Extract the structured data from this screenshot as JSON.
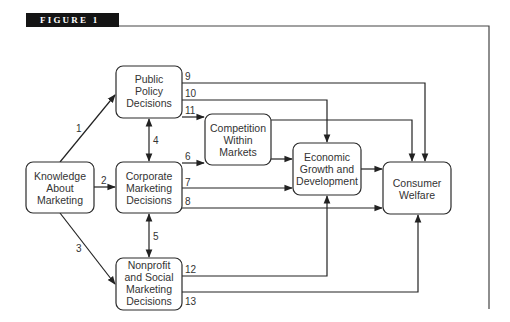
{
  "figure": {
    "title": "FIGURE 1"
  },
  "nodes": {
    "knowledge": {
      "lines": [
        "Knowledge",
        "About",
        "Marketing"
      ]
    },
    "public_policy": {
      "lines": [
        "Public",
        "Policy",
        "Decisions"
      ]
    },
    "corporate": {
      "lines": [
        "Corporate",
        "Marketing",
        "Decisions"
      ]
    },
    "nonprofit": {
      "lines": [
        "Nonprofit",
        "and Social",
        "Marketing",
        "Decisions"
      ]
    },
    "competition": {
      "lines": [
        "Competition",
        "Within",
        "Markets"
      ]
    },
    "economic": {
      "lines": [
        "Economic",
        "Growth and",
        "Development"
      ]
    },
    "consumer": {
      "lines": [
        "Consumer",
        "Welfare"
      ]
    }
  },
  "edges": [
    {
      "label": "1",
      "from": "Knowledge About Marketing",
      "to": "Public Policy Decisions"
    },
    {
      "label": "2",
      "from": "Knowledge About Marketing",
      "to": "Corporate Marketing Decisions"
    },
    {
      "label": "3",
      "from": "Knowledge About Marketing",
      "to": "Nonprofit and Social Marketing Decisions"
    },
    {
      "label": "4",
      "from": "Public Policy Decisions",
      "to": "Corporate Marketing Decisions",
      "bidirectional": true
    },
    {
      "label": "5",
      "from": "Corporate Marketing Decisions",
      "to": "Nonprofit and Social Marketing Decisions",
      "bidirectional": true
    },
    {
      "label": "6",
      "from": "Corporate Marketing Decisions",
      "to": "Competition Within Markets"
    },
    {
      "label": "7",
      "from": "Corporate Marketing Decisions",
      "to": "Economic Growth and Development"
    },
    {
      "label": "8",
      "from": "Corporate Marketing Decisions",
      "to": "Consumer Welfare"
    },
    {
      "label": "9",
      "from": "Public Policy Decisions",
      "to": "Consumer Welfare"
    },
    {
      "label": "10",
      "from": "Public Policy Decisions",
      "to": "Economic Growth and Development"
    },
    {
      "label": "11",
      "from": "Public Policy Decisions",
      "to": "Competition Within Markets"
    },
    {
      "label": "12",
      "from": "Nonprofit and Social Marketing Decisions",
      "to": "Economic Growth and Development"
    },
    {
      "label": "13",
      "from": "Nonprofit and Social Marketing Decisions",
      "to": "Consumer Welfare"
    },
    {
      "label": "",
      "from": "Competition Within Markets",
      "to": "Economic Growth and Development"
    },
    {
      "label": "",
      "from": "Competition Within Markets",
      "to": "Consumer Welfare"
    },
    {
      "label": "",
      "from": "Economic Growth and Development",
      "to": "Consumer Welfare"
    }
  ]
}
